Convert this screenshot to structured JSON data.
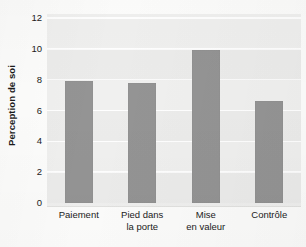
{
  "chart_data": {
    "type": "bar",
    "title": "",
    "subtitle": "",
    "xlabel": "",
    "ylabel": "Perception de soi",
    "categories": [
      "Paiement",
      "Pied dans la porte",
      "Mise en valeur",
      "Contrôle"
    ],
    "category_lines": [
      [
        "Paiement"
      ],
      [
        "Pied dans",
        "la porte"
      ],
      [
        "Mise",
        "en valeur"
      ],
      [
        "Contrôle"
      ]
    ],
    "values": [
      7.9,
      7.8,
      9.9,
      6.6
    ],
    "ylim": [
      0,
      12
    ],
    "yticks": [
      0,
      2,
      4,
      6,
      8,
      10,
      12
    ],
    "ytick_labels": [
      "0",
      "2",
      "4",
      "6",
      "8",
      "10",
      "12"
    ],
    "grid": "horizontal",
    "legend": "none",
    "annotations": [],
    "bar_color": "#949494",
    "plot_background": "#f0f0ef",
    "gridline_color": "#ffffff"
  },
  "axis": {
    "y_title": "Perception de soi"
  }
}
